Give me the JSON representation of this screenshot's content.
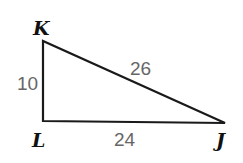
{
  "diagram": {
    "type": "right-triangle",
    "colors": {
      "stroke": "#1a1a1a",
      "vertex_label": "#111111",
      "side_label": "#666666",
      "background": "#ffffff"
    },
    "vertices": {
      "K": {
        "label": "K",
        "x": 43,
        "y": 41
      },
      "L": {
        "label": "L",
        "x": 43,
        "y": 121
      },
      "J": {
        "label": "J",
        "x": 225,
        "y": 123
      }
    },
    "sides": {
      "KL": {
        "label": "10"
      },
      "LJ": {
        "label": "24"
      },
      "KJ": {
        "label": "26"
      }
    }
  }
}
